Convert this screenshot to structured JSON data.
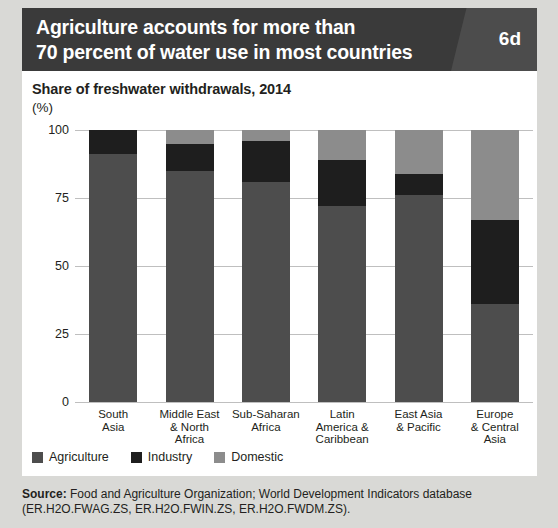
{
  "header": {
    "title_line1": "Agriculture accounts for more than",
    "title_line2": "70 percent of water use in most countries",
    "badge": "6d",
    "background_color": "#3a3a3a",
    "badge_panel_color": "#4c4c4c"
  },
  "source": {
    "label": "Source:",
    "text": " Food and Agriculture Organization; World Development Indicators database (ER.H2O.FWAG.ZS, ER.H2O.FWIN.ZS, ER.H2O.FWDM.ZS)."
  },
  "chart_data": {
    "type": "bar",
    "subtype": "stacked-column-100",
    "title": "Share of freshwater withdrawals, 2014",
    "subtitle": "",
    "xlabel": "",
    "ylabel": "(%)",
    "ylim": [
      0,
      100
    ],
    "yticks": [
      0,
      25,
      50,
      75,
      100
    ],
    "ytick_labels": [
      "0",
      "25",
      "50",
      "75",
      "100"
    ],
    "grid": true,
    "legend_position": "bottom-left",
    "categories": [
      "South Asia",
      "Middle East & North Africa",
      "Sub-Saharan Africa",
      "Latin America & Caribbean",
      "East Asia & Pacific",
      "Europe & Central Asia"
    ],
    "category_label_lines": [
      [
        "South",
        "Asia"
      ],
      [
        "Middle East",
        "& North",
        "Africa"
      ],
      [
        "Sub-Saharan",
        "Africa"
      ],
      [
        "Latin",
        "America &",
        "Caribbean"
      ],
      [
        "East Asia",
        "& Pacific"
      ],
      [
        "Europe",
        "& Central",
        "Asia"
      ]
    ],
    "series": [
      {
        "name": "Agriculture",
        "color": "#4d4d4d",
        "values": [
          91,
          85,
          81,
          72,
          76,
          36
        ]
      },
      {
        "name": "Industry",
        "color": "#1e1e1e",
        "values": [
          9,
          10,
          15,
          17,
          8,
          31
        ]
      },
      {
        "name": "Domestic",
        "color": "#8c8c8c",
        "values": [
          0,
          5,
          4,
          11,
          16,
          33
        ]
      }
    ]
  }
}
